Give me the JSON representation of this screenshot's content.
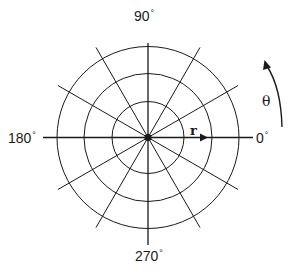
{
  "diagram": {
    "center": {
      "x": 148,
      "y": 137.5
    },
    "circle_radii": [
      36,
      64,
      91
    ],
    "spoke_radius": 104,
    "spoke_angles_deg": [
      0,
      30,
      60,
      90,
      120,
      150,
      180,
      210,
      240,
      270,
      300,
      330
    ],
    "axis": {
      "x_from": 43,
      "x_to": 253,
      "y_from": 43,
      "y_to": 245
    },
    "colors": {
      "line": "#1a1a1a",
      "background": "#ffffff"
    },
    "angle_labels": {
      "top": {
        "value": "90",
        "unit": "°"
      },
      "left": {
        "value": "180",
        "unit": "°"
      },
      "right": {
        "value": "0",
        "unit": "°"
      },
      "bottom": {
        "value": "270",
        "unit": "°"
      }
    },
    "radial_label": "r",
    "angular_label": "θ"
  }
}
